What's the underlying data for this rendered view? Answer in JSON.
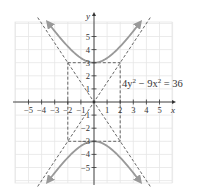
{
  "chart_data": {
    "type": "line",
    "title": "",
    "equation": "4y² − 9x² = 36",
    "equation_parts": {
      "a": "4y",
      "a_exp": "2",
      "op": " − 9x",
      "b_exp": "2",
      "rhs": " = 36"
    },
    "xlabel": "x",
    "ylabel": "y",
    "xlim": [
      -6,
      6
    ],
    "ylim": [
      -6,
      6
    ],
    "grid": true,
    "x_ticks": [
      -5,
      -4,
      -3,
      -2,
      -1,
      1,
      2,
      3,
      4,
      5
    ],
    "x_tick_labels": [
      "−5",
      "−4",
      "−3",
      "−2",
      "−1",
      "1",
      "2",
      "3",
      "4",
      "5"
    ],
    "y_ticks": [
      5,
      4,
      3,
      2,
      1,
      -1,
      -2,
      -3,
      -4,
      -5
    ],
    "y_tick_labels": [
      "5",
      "4",
      "3",
      "2",
      "1",
      "−1",
      "−2",
      "−3",
      "−4",
      "−5"
    ],
    "series": [
      {
        "name": "upper branch",
        "style": "solid",
        "color": "#999999",
        "function": "y = sqrt(9 + 9x²/4)",
        "x_range": [
          -3.5,
          3.5
        ],
        "vertex": [
          0,
          3
        ]
      },
      {
        "name": "lower branch",
        "style": "solid",
        "color": "#999999",
        "function": "y = -sqrt(9 + 9x²/4)",
        "x_range": [
          -3.5,
          3.5
        ],
        "vertex": [
          0,
          -3
        ]
      },
      {
        "name": "asymptote 1",
        "style": "dashed",
        "color": "#555555",
        "function": "y = 1.5x",
        "x_range": [
          -4.3,
          4.3
        ]
      },
      {
        "name": "asymptote 2",
        "style": "dashed",
        "color": "#555555",
        "function": "y = -1.5x",
        "x_range": [
          -4.3,
          4.3
        ]
      }
    ],
    "fundamental_rectangle": {
      "x": [
        -2,
        2
      ],
      "y": [
        -3,
        3
      ],
      "style": "dashed"
    },
    "colors": {
      "curve": "#999999",
      "dashed": "#555555",
      "grid": "#e6e6e6",
      "axis": "#333333"
    }
  }
}
